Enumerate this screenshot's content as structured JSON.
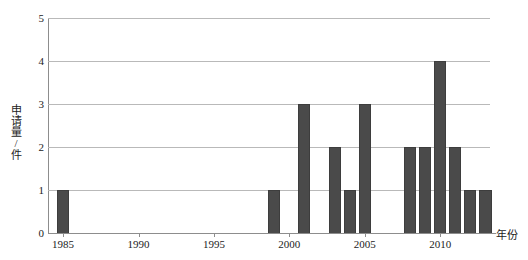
{
  "chart_data": {
    "type": "bar",
    "title": "",
    "subtitle": "",
    "xlabel": "年份",
    "ylabel": "申请量/件",
    "ylim": [
      0,
      5
    ],
    "xlim": [
      1984.5,
      2013.8
    ],
    "grid": true,
    "legend": null,
    "bar_color": "#4a4a4a",
    "grid_color": "#b9b9b9",
    "axis_color": "#8d8d8d",
    "y_ticks": [
      0,
      1,
      2,
      3,
      4,
      5
    ],
    "y_tick_labels": [
      "0",
      "1",
      "2",
      "3",
      "4",
      "5"
    ],
    "x_ticks": [
      1985,
      1990,
      1995,
      2000,
      2005,
      2010
    ],
    "x_tick_labels": [
      "1985",
      "1990",
      "1995",
      "2000",
      "2005",
      "2010"
    ],
    "categories": [
      "1985",
      "1986",
      "1987",
      "1988",
      "1989",
      "1990",
      "1991",
      "1992",
      "1993",
      "1994",
      "1995",
      "1996",
      "1997",
      "1998",
      "1999",
      "2000",
      "2001",
      "2002",
      "2003",
      "2004",
      "2005",
      "2006",
      "2007",
      "2008",
      "2009",
      "2010",
      "2011",
      "2012",
      "2013"
    ],
    "values": [
      1,
      0,
      0,
      0,
      0,
      0,
      0,
      0,
      0,
      0,
      0,
      0,
      0,
      0,
      1,
      0,
      3,
      0,
      2,
      1,
      3,
      0,
      0,
      2,
      2,
      4,
      2,
      1,
      1
    ]
  }
}
